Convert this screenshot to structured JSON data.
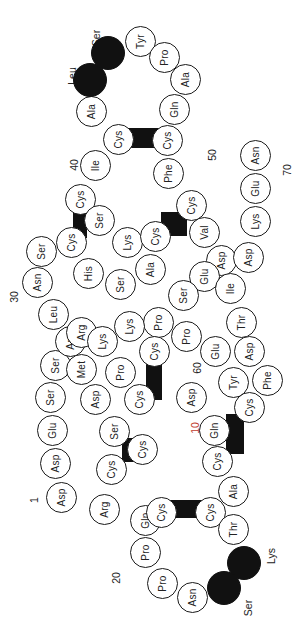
{
  "diagram": {
    "type": "peptide-sequence-diagram",
    "orientation": "rotated-90-ccw",
    "residues": [
      {
        "name": "Asp",
        "x": 62,
        "y": 498
      },
      {
        "name": "Asp",
        "x": 56,
        "y": 464
      },
      {
        "name": "Glu",
        "x": 53,
        "y": 431
      },
      {
        "name": "Ser",
        "x": 51,
        "y": 398
      },
      {
        "name": "Ser",
        "x": 56,
        "y": 366
      },
      {
        "name": "Arg",
        "x": 71,
        "y": 342
      },
      {
        "name": "Leu",
        "x": 54,
        "y": 315
      },
      {
        "name": "Asn",
        "x": 38,
        "y": 283
      },
      {
        "name": "Ser",
        "x": 42,
        "y": 252
      },
      {
        "name": "Cys",
        "x": 72,
        "y": 243
      },
      {
        "name": "Cys",
        "x": 81,
        "y": 200
      },
      {
        "name": "Ile",
        "x": 96,
        "y": 166
      },
      {
        "name": "Cys",
        "x": 119,
        "y": 140
      },
      {
        "name": "Ala",
        "x": 92,
        "y": 112
      },
      {
        "name": "Leu",
        "x": 90,
        "y": 80,
        "dark": true
      },
      {
        "name": "Ser",
        "x": 108,
        "y": 53,
        "dark": true
      },
      {
        "name": "Tyr",
        "x": 141,
        "y": 42
      },
      {
        "name": "Pro",
        "x": 165,
        "y": 58
      },
      {
        "name": "Ala",
        "x": 186,
        "y": 80
      },
      {
        "name": "Gln",
        "x": 175,
        "y": 110
      },
      {
        "name": "Cys",
        "x": 168,
        "y": 141
      },
      {
        "name": "Phe",
        "x": 169,
        "y": 174
      },
      {
        "name": "Cys",
        "x": 192,
        "y": 206
      },
      {
        "name": "Val",
        "x": 205,
        "y": 233
      },
      {
        "name": "Asp",
        "x": 222,
        "y": 261
      },
      {
        "name": "Asp",
        "x": 249,
        "y": 258
      },
      {
        "name": "Lys",
        "x": 256,
        "y": 222
      },
      {
        "name": "Glu",
        "x": 256,
        "y": 189
      },
      {
        "name": "Asn",
        "x": 256,
        "y": 156
      },
      {
        "name": "Ser",
        "x": 100,
        "y": 221
      },
      {
        "name": "Lys",
        "x": 128,
        "y": 243
      },
      {
        "name": "Cys",
        "x": 156,
        "y": 237
      },
      {
        "name": "His",
        "x": 89,
        "y": 274
      },
      {
        "name": "Ser",
        "x": 121,
        "y": 285
      },
      {
        "name": "Ala",
        "x": 151,
        "y": 270
      },
      {
        "name": "Glu",
        "x": 205,
        "y": 277
      },
      {
        "name": "Ile",
        "x": 231,
        "y": 289
      },
      {
        "name": "Ser",
        "x": 184,
        "y": 296
      },
      {
        "name": "Pro",
        "x": 159,
        "y": 323
      },
      {
        "name": "Lys",
        "x": 130,
        "y": 327
      },
      {
        "name": "Cys",
        "x": 155,
        "y": 352
      },
      {
        "name": "Pro",
        "x": 187,
        "y": 337
      },
      {
        "name": "Thr",
        "x": 242,
        "y": 323
      },
      {
        "name": "Arg",
        "x": 82,
        "y": 333
      },
      {
        "name": "Lys",
        "x": 103,
        "y": 342
      },
      {
        "name": "Met",
        "x": 82,
        "y": 370
      },
      {
        "name": "Pro",
        "x": 121,
        "y": 373
      },
      {
        "name": "Asp",
        "x": 96,
        "y": 400
      },
      {
        "name": "Ser",
        "x": 115,
        "y": 432
      },
      {
        "name": "Cys",
        "x": 140,
        "y": 400
      },
      {
        "name": "Cys",
        "x": 143,
        "y": 450
      },
      {
        "name": "Cys",
        "x": 112,
        "y": 470
      },
      {
        "name": "Arg",
        "x": 105,
        "y": 510
      },
      {
        "name": "Glu",
        "x": 216,
        "y": 352
      },
      {
        "name": "Asp",
        "x": 250,
        "y": 352
      },
      {
        "name": "Tyr",
        "x": 234,
        "y": 383
      },
      {
        "name": "Phe",
        "x": 268,
        "y": 381
      },
      {
        "name": "Asp",
        "x": 192,
        "y": 398
      },
      {
        "name": "Gln",
        "x": 215,
        "y": 431
      },
      {
        "name": "Cys",
        "x": 250,
        "y": 408
      },
      {
        "name": "Cys",
        "x": 218,
        "y": 462
      },
      {
        "name": "Ala",
        "x": 234,
        "y": 492
      },
      {
        "name": "Cys",
        "x": 211,
        "y": 513
      },
      {
        "name": "Thr",
        "x": 234,
        "y": 530
      },
      {
        "name": "Lys",
        "x": 244,
        "y": 563,
        "dark": true
      },
      {
        "name": "Ser",
        "x": 224,
        "y": 588,
        "dark": true
      },
      {
        "name": "Asn",
        "x": 193,
        "y": 598
      },
      {
        "name": "Pro",
        "x": 163,
        "y": 584
      },
      {
        "name": "Pro",
        "x": 146,
        "y": 553
      },
      {
        "name": "Gln",
        "x": 146,
        "y": 521
      },
      {
        "name": "Cys",
        "x": 162,
        "y": 513
      }
    ],
    "residue_labels": [
      {
        "text": "Ser",
        "x": 97,
        "y": 38
      },
      {
        "text": "Leu",
        "x": 72,
        "y": 76
      },
      {
        "text": "Lys",
        "x": 272,
        "y": 556
      },
      {
        "text": "Ser",
        "x": 249,
        "y": 608
      }
    ],
    "position_labels": [
      {
        "text": "1",
        "x": 37,
        "y": 500
      },
      {
        "text": "20",
        "x": 116,
        "y": 578
      },
      {
        "text": "30",
        "x": 14,
        "y": 297
      },
      {
        "text": "40",
        "x": 74,
        "y": 165
      },
      {
        "text": "50",
        "x": 212,
        "y": 155
      },
      {
        "text": "60",
        "x": 197,
        "y": 368
      },
      {
        "text": "70",
        "x": 287,
        "y": 170
      },
      {
        "text": "10",
        "x": 195,
        "y": 428,
        "red": true
      }
    ],
    "disulfide_bridges": [
      {
        "x": 127,
        "y": 128,
        "w": 34,
        "h": 20
      },
      {
        "x": 73,
        "y": 208,
        "w": 14,
        "h": 30
      },
      {
        "x": 161,
        "y": 212,
        "w": 26,
        "h": 24
      },
      {
        "x": 146,
        "y": 360,
        "w": 16,
        "h": 40
      },
      {
        "x": 122,
        "y": 438,
        "w": 22,
        "h": 24
      },
      {
        "x": 226,
        "y": 414,
        "w": 18,
        "h": 40
      },
      {
        "x": 167,
        "y": 500,
        "w": 36,
        "h": 18
      }
    ],
    "colors": {
      "outline": "#1a1a1a",
      "dark_residue": "#111111",
      "highlight_text": "#c0392b"
    }
  }
}
